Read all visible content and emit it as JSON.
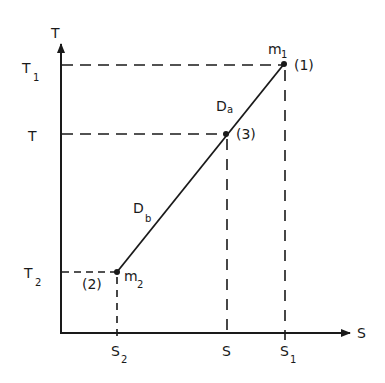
{
  "diagram": {
    "type": "T-S diagram (temperature vs. entropy, mixing line)",
    "axes": {
      "x_label": "S",
      "y_label": "T"
    },
    "y_ticks": [
      {
        "base": "T",
        "sub": "1",
        "id": "T1"
      },
      {
        "base": "T",
        "sub": "",
        "id": "T"
      },
      {
        "base": "T",
        "sub": "2",
        "id": "T2"
      }
    ],
    "x_ticks": [
      {
        "base": "S",
        "sub": "2",
        "id": "S2"
      },
      {
        "base": "S",
        "sub": "",
        "id": "S"
      },
      {
        "base": "S",
        "sub": "1",
        "id": "S1"
      }
    ],
    "points": [
      {
        "id": "1",
        "label": "(1)",
        "mass_base": "m",
        "mass_sub": "1"
      },
      {
        "id": "3",
        "label": "(3)",
        "mass_base": "",
        "mass_sub": ""
      },
      {
        "id": "2",
        "label": "(2)",
        "mass_base": "m",
        "mass_sub": "2"
      }
    ],
    "segments": [
      {
        "label_base": "D",
        "label_sub": "a",
        "from": "3",
        "to": "1"
      },
      {
        "label_base": "D",
        "label_sub": "b",
        "from": "2",
        "to": "3"
      }
    ]
  }
}
